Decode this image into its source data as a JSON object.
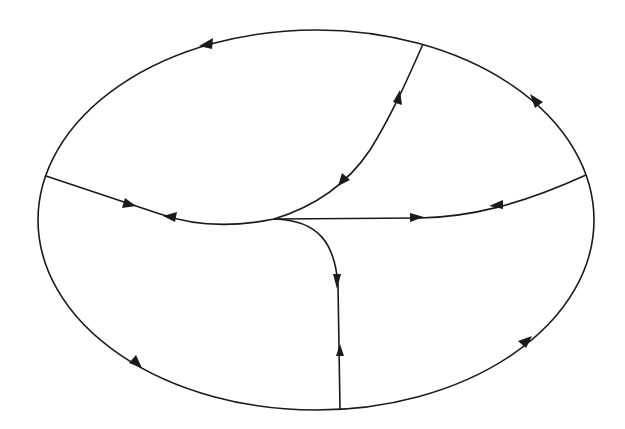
{
  "diagram": {
    "type": "phase-portrait",
    "stroke_color": "#1a1a1a",
    "background": "#ffffff",
    "boundary": {
      "shape": "ellipse",
      "cx": 316,
      "cy": 220,
      "rx": 278,
      "ry": 190
    },
    "nodes": [
      {
        "id": "center",
        "x": 274,
        "y": 219
      },
      {
        "id": "left",
        "x": 46,
        "y": 176
      },
      {
        "id": "right",
        "x": 586,
        "y": 175
      },
      {
        "id": "top",
        "x": 423,
        "y": 44
      },
      {
        "id": "bottom",
        "x": 340,
        "y": 409
      }
    ],
    "arrows": [
      {
        "on": "boundary-top-left",
        "x": 207,
        "y": 44,
        "direction": "left"
      },
      {
        "on": "boundary-top-right",
        "x": 537,
        "y": 103,
        "direction": "up-left"
      },
      {
        "on": "boundary-bottom-left",
        "x": 136,
        "y": 363,
        "direction": "down-right"
      },
      {
        "on": "boundary-bottom-right",
        "x": 525,
        "y": 343,
        "direction": "up-right"
      },
      {
        "on": "left-to-center",
        "x": 128,
        "y": 204,
        "direction": "right"
      },
      {
        "on": "left-to-center",
        "x": 172,
        "y": 218,
        "direction": "left"
      },
      {
        "on": "center-to-top",
        "x": 397,
        "y": 98,
        "direction": "up"
      },
      {
        "on": "center-to-top",
        "x": 344,
        "y": 180,
        "direction": "down-left"
      },
      {
        "on": "center-to-right",
        "x": 416,
        "y": 217,
        "direction": "right"
      },
      {
        "on": "center-to-right",
        "x": 497,
        "y": 205,
        "direction": "left"
      },
      {
        "on": "center-to-bottom",
        "x": 337,
        "y": 280,
        "direction": "down"
      },
      {
        "on": "center-to-bottom",
        "x": 340,
        "y": 352,
        "direction": "up"
      }
    ]
  }
}
